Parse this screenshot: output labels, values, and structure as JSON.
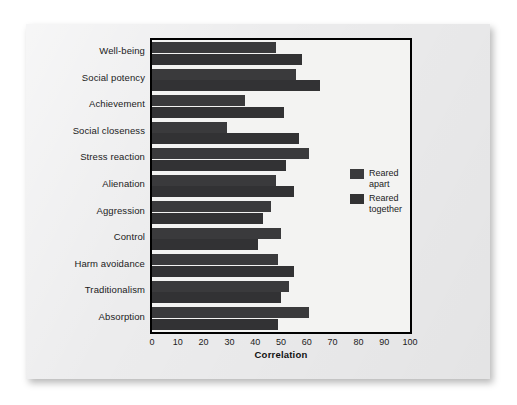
{
  "chart_data": {
    "type": "bar",
    "orientation": "horizontal",
    "title": "",
    "xlabel": "Correlation",
    "ylabel": "",
    "xlim": [
      0,
      100
    ],
    "xticks": [
      0,
      10,
      20,
      30,
      40,
      50,
      60,
      70,
      80,
      90,
      100
    ],
    "grid": false,
    "legend_position": "right-middle",
    "categories": [
      "Well-being",
      "Social potency",
      "Achievement",
      "Social closeness",
      "Stress reaction",
      "Alienation",
      "Aggression",
      "Control",
      "Harm avoidance",
      "Traditionalism",
      "Absorption"
    ],
    "series": [
      {
        "name": "Reared apart",
        "color": "#3a3a3c",
        "values": [
          48,
          56,
          36,
          29,
          61,
          48,
          46,
          50,
          49,
          53,
          61
        ]
      },
      {
        "name": "Reared together",
        "color": "#323234",
        "values": [
          58,
          65,
          51,
          57,
          52,
          55,
          43,
          41,
          55,
          50,
          49
        ]
      }
    ]
  },
  "axis": {
    "x_title": "Correlation",
    "tick_labels": [
      "0",
      "10",
      "20",
      "30",
      "40",
      "50",
      "60",
      "70",
      "80",
      "90",
      "100"
    ]
  },
  "legend": {
    "entries": [
      {
        "label_line1": "Reared",
        "label_line2": "apart"
      },
      {
        "label_line1": "Reared",
        "label_line2": "together"
      }
    ]
  },
  "colors": {
    "bar_apart": "#3a3a3c",
    "bar_together": "#323234",
    "plot_background": "#f3f3f2",
    "card_background": "#ececed",
    "axis_line": "#000000"
  }
}
